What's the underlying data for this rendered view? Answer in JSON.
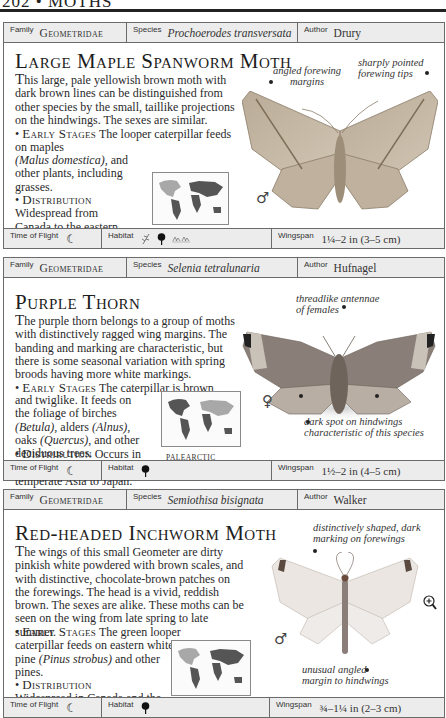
{
  "page": {
    "header": "202 • MOTHS"
  },
  "labels": {
    "family": "Family",
    "species": "Species",
    "author": "Author",
    "time_of_flight": "Time of Flight",
    "habitat": "Habitat",
    "wingspan": "Wingspan",
    "early_stages": "Early Stages",
    "distribution": "Distribution"
  },
  "entries": [
    {
      "family": "Geometridae",
      "species": "Prochoerodes transversata",
      "author": "Drury",
      "title": "Large Maple Spanworm Moth",
      "description_dropcap": "T",
      "description": "his large, pale yellowish brown moth with dark brown lines can be distinguished from other species by the small, taillike projections on the hindwings. The sexes are similar.",
      "early_stages_pre": "The looper caterpillar feeds on maples ",
      "early_stages_it1": "(Acer)",
      "early_stages_mid1": ", apple ",
      "early_stages_it2": "(Malus domestica)",
      "early_stages_post": ", and other plants, including grasses.",
      "distribution": "Widespread from Canada to the eastern USA.",
      "map_region": "NEARCTIC",
      "sex": "♂",
      "annotations": [
        "angled forewing margins",
        "sharply pointed forewing tips"
      ],
      "time_of_flight_icon": "crescent-moon-icon",
      "time_of_flight_glyph": "☾",
      "habitat_icons": [
        "grass-icon",
        "tree-icon",
        "grassland-icon"
      ],
      "wingspan": "1¼–2 in (3–5 cm)"
    },
    {
      "family": "Geometridae",
      "species": "Selenia tetralunaria",
      "author": "Hufnagel",
      "title": "Purple Thorn",
      "description_dropcap": "T",
      "description": "he purple thorn belongs to a group of moths with distinctively ragged wing margins. The banding and marking are characteristic, but there is some seasonal variation with spring broods having more white markings.",
      "early_stages_pre": "The caterpillar is brown and twiglike. It feeds on the foliage of birches ",
      "early_stages_it1": "(Betula)",
      "early_stages_mid1": ", alders ",
      "early_stages_it2": "(Alnus)",
      "early_stages_mid2": ", oaks ",
      "early_stages_it3": "(Quercus)",
      "early_stages_post": ", and other deciduous trees.",
      "distribution": "Occurs in Europe, extending across temperate Asia to Japan.",
      "map_region": "PALEARCTIC",
      "sex": "♀",
      "annotations": [
        "threadlike antennae of females",
        "dark spot on hindwings characteristic of this species"
      ],
      "time_of_flight_icon": "crescent-moon-icon",
      "time_of_flight_glyph": "☾",
      "habitat_icons": [
        "tree-icon"
      ],
      "wingspan": "1½–2 in (4–5 cm)"
    },
    {
      "family": "Geometridae",
      "species": "Semiothisa bisignata",
      "author": "Walker",
      "title": "Red-headed Inchworm Moth",
      "description_dropcap": "T",
      "description": "he wings of this small Geometer are dirty pinkish white powdered with brown scales, and with distinctive, chocolate-brown patches on the forewings. The head is a vivid, reddish brown. The sexes are alike. These moths can be seen on the wing from late spring to late summer.",
      "early_stages_pre": "The green looper caterpillar feeds on eastern white pine ",
      "early_stages_it1": "(Pinus strobus)",
      "early_stages_post": " and other pines.",
      "distribution": "Widespread in Canada and the northern USA.",
      "map_region": "NEARCTIC",
      "sex": "♂",
      "annotations": [
        "distinctively shaped, dark marking on forewings",
        "unusual angled margin to hindwings"
      ],
      "time_of_flight_icon": "crescent-moon-icon",
      "time_of_flight_glyph": "☾",
      "habitat_icons": [
        "tree-icon"
      ],
      "wingspan": "¾–1¼ in (2–3 cm)"
    }
  ]
}
